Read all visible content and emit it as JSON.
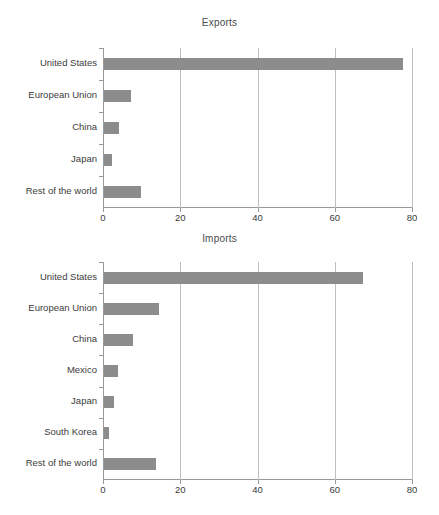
{
  "figure": {
    "background_color": "#ffffff",
    "bar_color": "#8c8c8c",
    "axis_color": "#9a9a9a",
    "grid_color": "#bfbfbf",
    "text_color": "#3c3c3c"
  },
  "chart_data": [
    {
      "type": "bar",
      "orientation": "horizontal",
      "title": "Exports",
      "xlabel": "",
      "ylabel": "",
      "xlim": [
        0,
        80
      ],
      "xticks": [
        0,
        20,
        40,
        60,
        80
      ],
      "xticklabels": [
        "0",
        "20",
        "40",
        "60",
        "80"
      ],
      "grid": "vertical",
      "legend": "none",
      "categories": [
        "United States",
        "European Union",
        "China",
        "Japan",
        "Rest of the world"
      ],
      "values": [
        77.5,
        7.0,
        4.0,
        2.0,
        9.5
      ]
    },
    {
      "type": "bar",
      "orientation": "horizontal",
      "title": "Imports",
      "xlabel": "",
      "ylabel": "",
      "xlim": [
        0,
        80
      ],
      "xticks": [
        0,
        20,
        40,
        60,
        80
      ],
      "xticklabels": [
        "0",
        "20",
        "40",
        "60",
        "80"
      ],
      "grid": "vertical",
      "legend": "none",
      "categories": [
        "United States",
        "European Union",
        "China",
        "Mexico",
        "Japan",
        "South Korea",
        "Rest of the world"
      ],
      "values": [
        67.0,
        14.2,
        7.5,
        3.5,
        2.5,
        1.3,
        13.5
      ]
    }
  ]
}
